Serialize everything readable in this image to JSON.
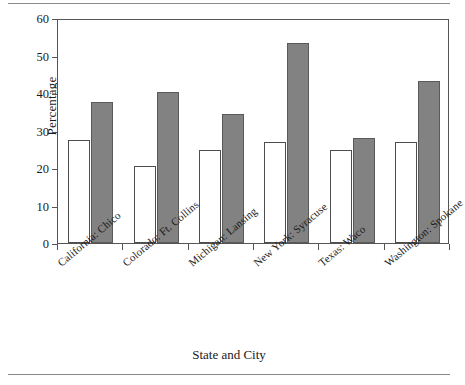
{
  "chart_data": {
    "type": "bar",
    "title": "",
    "xlabel": "State and City",
    "ylabel": "Percentage",
    "ylim": [
      0,
      60
    ],
    "yticks": [
      0,
      10,
      20,
      30,
      40,
      50,
      60
    ],
    "grid": false,
    "legend": "none",
    "categories": [
      "California: Chico",
      "Colorado: Ft. Collins",
      "Michigan: Lansing",
      "New York: Syracuse",
      "Texas: Waco",
      "Washington: Spokane"
    ],
    "series": [
      {
        "name": "open",
        "color": "#ffffff",
        "values": [
          27.5,
          20.5,
          24.8,
          27.0,
          24.7,
          26.9
        ]
      },
      {
        "name": "filled",
        "color": "#828282",
        "values": [
          37.7,
          40.2,
          34.3,
          53.4,
          28.0,
          43.2
        ]
      }
    ]
  },
  "figure": {
    "axis_color": "#555555",
    "rule_color": "#8a8a8a"
  }
}
